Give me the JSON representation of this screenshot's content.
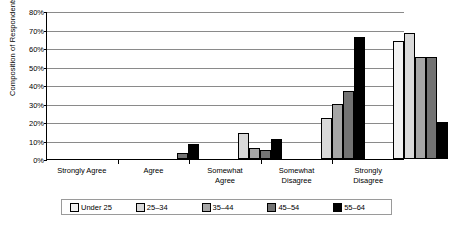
{
  "chart_data": {
    "type": "bar",
    "title": "",
    "subtitle": "",
    "xlabel": "",
    "ylabel": "Composition of Respondents",
    "ylim": [
      0,
      80
    ],
    "ytick_labels": [
      "80%",
      "70%",
      "60%",
      "50%",
      "40%",
      "30%",
      "20%",
      "10%",
      "0%"
    ],
    "ytick_values": [
      80,
      70,
      60,
      50,
      40,
      30,
      20,
      10,
      0
    ],
    "grid": true,
    "legend_position": "bottom",
    "categories": [
      "Strongly Agree",
      "Agree",
      "Somewhat Agree",
      "Somewhat Disagree",
      "Strongly Disagree"
    ],
    "category_lines": [
      [
        "Strongly Agree"
      ],
      [
        "Agree"
      ],
      [
        "Somewhat",
        "Agree"
      ],
      [
        "Somewhat",
        "Disagree"
      ],
      [
        "Strongly",
        "Disagree"
      ]
    ],
    "series": [
      {
        "name": "Under 25",
        "color": "#f2f2f2",
        "values": [
          0,
          0,
          0,
          0,
          64
        ]
      },
      {
        "name": "25–34",
        "color": "#d9d9d9",
        "values": [
          0,
          0,
          14,
          22,
          68
        ]
      },
      {
        "name": "35–44",
        "color": "#a6a6a6",
        "values": [
          0,
          0,
          6,
          30,
          55
        ]
      },
      {
        "name": "45–54",
        "color": "#737373",
        "values": [
          0,
          3,
          5,
          37,
          55
        ]
      },
      {
        "name": "55–64",
        "color": "#000000",
        "values": [
          0,
          8,
          11,
          66,
          20
        ]
      }
    ]
  },
  "legend": {
    "items": [
      {
        "label": "Under 25",
        "color": "#f2f2f2"
      },
      {
        "label": "25–34",
        "color": "#d9d9d9"
      },
      {
        "label": "35–44",
        "color": "#a6a6a6"
      },
      {
        "label": "45–54",
        "color": "#737373"
      },
      {
        "label": "55–64",
        "color": "#000000"
      }
    ]
  }
}
